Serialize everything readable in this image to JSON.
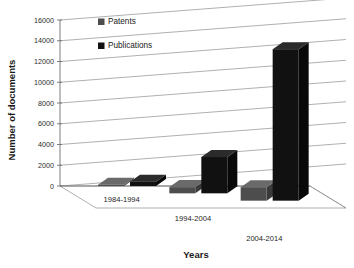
{
  "chart_data": {
    "type": "bar",
    "title": "",
    "subtitle": "",
    "xlabel": "Years",
    "ylabel": "Number of documents",
    "categories": [
      "1984-1994",
      "1994-2004",
      "2004-2014"
    ],
    "series": [
      {
        "name": "Patents",
        "values": [
          120,
          600,
          1300
        ],
        "color": "#4d4d4d"
      },
      {
        "name": "Publications",
        "values": [
          420,
          3500,
          14600
        ],
        "color": "#111111"
      }
    ],
    "ylim": [
      0,
      16000
    ],
    "yticks": [
      0,
      2000,
      4000,
      6000,
      8000,
      10000,
      12000,
      14000,
      16000
    ],
    "ytick_labels": [
      "0",
      "2000",
      "4000",
      "6000",
      "8000",
      "10000",
      "12000",
      "14000",
      "16000"
    ],
    "grid": true,
    "grid_axis": "y",
    "legend_position": "inside-top-left",
    "projection": "3d",
    "legend": [
      {
        "label": "Patents",
        "swatch": "#4d4d4d"
      },
      {
        "label": "Publications",
        "swatch": "#111111"
      }
    ]
  },
  "colors": {
    "background": "#ffffff",
    "gridline": "#8e8e8e",
    "axis": "#6f6f6f",
    "patents": "#4d4d4d",
    "patents_top": "#6a6a6a",
    "patents_side": "#3a3a3a",
    "publications": "#111111",
    "publications_top": "#2b2b2b",
    "publications_side": "#080808",
    "text": "#1a1a1a"
  }
}
